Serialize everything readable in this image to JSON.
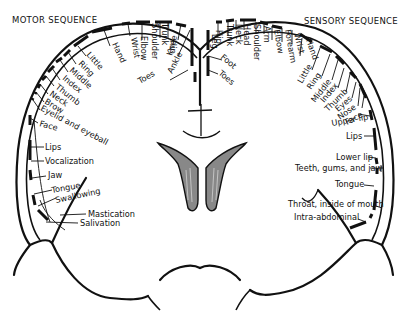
{
  "headers": {
    "motor": "MOTOR SEQUENCE",
    "sensory": "SENSORY SEQUENCE"
  },
  "motor_labels": {
    "toes": "Toes",
    "ankle": "Ankle",
    "knee": "Knee",
    "hip": "Hip",
    "trunk": "Trunk",
    "shoulder": "Shoulder",
    "elbow": "Elbow",
    "wrist": "Wrist",
    "hand": "Hand",
    "little": "Little",
    "ring": "Ring",
    "middle": "Middle",
    "index": "Index",
    "thumb": "Thumb",
    "neck": "Neck",
    "brow": "Brow",
    "eyelid": "Eyelid and eyeball",
    "face": "Face",
    "lips": "Lips",
    "vocalization": "Vocalization",
    "jaw": "Jaw",
    "tongue": "Tongue",
    "swallowing": "Swallowing",
    "mastication": "Mastication",
    "salivation": "Salivation"
  },
  "sensory_labels": {
    "toes": "Toes",
    "foot": "Foot",
    "leg": "Leg",
    "hip": "Hip",
    "trunk": "Trunk",
    "neck": "Neck",
    "head": "Head",
    "shoulder": "Shoulder",
    "arm": "Arm",
    "elbow": "Elbow",
    "forearm": "Forearm",
    "wrist": "Wrist",
    "hand": "Hand",
    "little": "Little",
    "ring": "Ring",
    "middle": "Middle",
    "index": "Index",
    "thumb": "Thumb",
    "eyes": "Eyes",
    "nose": "Nose",
    "face": "Face",
    "upper_lip": "Upper lip",
    "lips": "Lips",
    "lower_lip": "Lower lip",
    "teeth": "Teeth, gums, and jaw",
    "tongue": "Tongue",
    "throat": "Throat, inside of mouth",
    "intra_abdominal": "Intra-abdominal"
  },
  "colors": {
    "ink": "#111111",
    "background": "#ffffff",
    "ventricle_fill": "#888888"
  }
}
